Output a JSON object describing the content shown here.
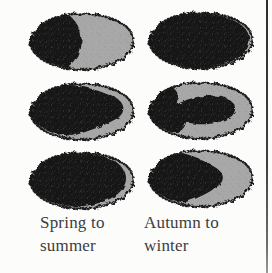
{
  "figure": {
    "columns": [
      {
        "id": "spring-to-summer",
        "label_lines": [
          "Spring to",
          "summer"
        ],
        "stages": [
          {
            "stage": 1,
            "pattern": "dark-head-left"
          },
          {
            "stage": 2,
            "pattern": "dark-spreading-middle"
          },
          {
            "stage": 3,
            "pattern": "mostly-dark"
          }
        ]
      },
      {
        "id": "autumn-to-winter",
        "label_lines": [
          "Autumn to",
          "winter"
        ],
        "stages": [
          {
            "stage": 1,
            "pattern": "fully-dark"
          },
          {
            "stage": 2,
            "pattern": "dark-head-and-band"
          },
          {
            "stage": 3,
            "pattern": "dark-front-half"
          }
        ]
      }
    ],
    "colors": {
      "background": "#fbfbfa",
      "egg_gray": "#a8a8a8",
      "patch_dark": "#161616",
      "outline": "#1b1b1b",
      "rule_line": "#3f3f3f",
      "label_text": "#3d3d40"
    }
  }
}
